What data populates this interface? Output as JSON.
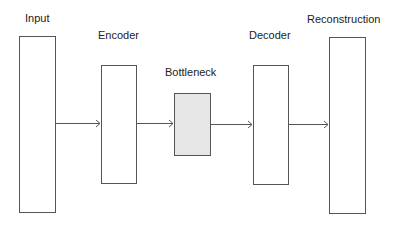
{
  "diagram": {
    "nodes": [
      {
        "id": "input",
        "label": "Input",
        "fill": "#ffffff"
      },
      {
        "id": "encoder",
        "label": "Encoder",
        "fill": "#ffffff"
      },
      {
        "id": "bottleneck",
        "label": "Bottleneck",
        "fill": "#e6e6e6"
      },
      {
        "id": "decoder",
        "label": "Decoder",
        "fill": "#ffffff"
      },
      {
        "id": "reconstruction",
        "label": "Reconstruction",
        "fill": "#ffffff"
      }
    ],
    "edges": [
      {
        "from": "input",
        "to": "encoder"
      },
      {
        "from": "encoder",
        "to": "bottleneck"
      },
      {
        "from": "bottleneck",
        "to": "decoder"
      },
      {
        "from": "decoder",
        "to": "reconstruction"
      }
    ]
  }
}
